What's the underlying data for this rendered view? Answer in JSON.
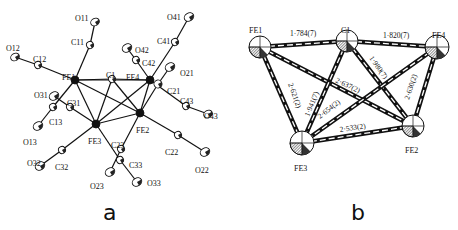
{
  "figure": {
    "panels": [
      {
        "id": "a",
        "letter": "a",
        "title": "ORTEP view of Fe4C(CO)12 cluster",
        "atoms": [
          {
            "label": "FE1",
            "x": 75,
            "y": 80,
            "r": 4,
            "type": "fe",
            "lx": 62,
            "ly": 74
          },
          {
            "label": "C1",
            "x": 112,
            "y": 79,
            "r": 3.5,
            "type": "c",
            "lx": 106,
            "ly": 72
          },
          {
            "label": "FE4",
            "x": 150,
            "y": 80,
            "r": 4,
            "type": "fe",
            "lx": 126,
            "ly": 74
          },
          {
            "label": "FE2",
            "x": 140,
            "y": 113,
            "r": 4,
            "type": "fe",
            "lx": 136,
            "ly": 127
          },
          {
            "label": "FE3",
            "x": 96,
            "y": 124,
            "r": 4,
            "type": "fe",
            "lx": 88,
            "ly": 138
          },
          {
            "label": "C11",
            "x": 90,
            "y": 45,
            "r": 3.5,
            "type": "c",
            "lx": 71,
            "ly": 39
          },
          {
            "label": "O11",
            "x": 95,
            "y": 22,
            "r": 4.5,
            "type": "o",
            "lx": 75,
            "ly": 15
          },
          {
            "label": "C12",
            "x": 38,
            "y": 65,
            "r": 3.5,
            "type": "c",
            "lx": 33,
            "ly": 56
          },
          {
            "label": "O12",
            "x": 15,
            "y": 57,
            "r": 4.5,
            "type": "o",
            "lx": 6,
            "ly": 45
          },
          {
            "label": "C41",
            "x": 175,
            "y": 42,
            "r": 3.5,
            "type": "c",
            "lx": 157,
            "ly": 38
          },
          {
            "label": "O41",
            "x": 189,
            "y": 17,
            "r": 5,
            "type": "o",
            "lx": 167,
            "ly": 14
          },
          {
            "label": "C42",
            "x": 136,
            "y": 60,
            "r": 3.5,
            "type": "c",
            "lx": 142,
            "ly": 60
          },
          {
            "label": "O42",
            "x": 127,
            "y": 48,
            "r": 5,
            "type": "o",
            "lx": 135,
            "ly": 47
          },
          {
            "label": "O21",
            "x": 170,
            "y": 67,
            "r": 5,
            "type": "o",
            "lx": 180,
            "ly": 70
          },
          {
            "label": "C21",
            "x": 158,
            "y": 84,
            "r": 4,
            "type": "c",
            "lx": 167,
            "ly": 88
          },
          {
            "label": "C43",
            "x": 186,
            "y": 106,
            "r": 3.5,
            "type": "c",
            "lx": 180,
            "ly": 98
          },
          {
            "label": "O43",
            "x": 208,
            "y": 114,
            "r": 4.5,
            "type": "o",
            "lx": 204,
            "ly": 113
          },
          {
            "label": "O31",
            "x": 54,
            "y": 96,
            "r": 5,
            "type": "o",
            "lx": 34,
            "ly": 92
          },
          {
            "label": "C31",
            "x": 70,
            "y": 107,
            "r": 3.5,
            "type": "c",
            "lx": 67,
            "ly": 100
          },
          {
            "label": "C13",
            "x": 53,
            "y": 107,
            "r": 3.5,
            "type": "c",
            "lx": 49,
            "ly": 119
          },
          {
            "label": "O13",
            "x": 38,
            "y": 126,
            "r": 5,
            "type": "o",
            "lx": 23,
            "ly": 139
          },
          {
            "label": "C32",
            "x": 62,
            "y": 150,
            "r": 3.5,
            "type": "c",
            "lx": 55,
            "ly": 164
          },
          {
            "label": "O32",
            "x": 40,
            "y": 166,
            "r": 5,
            "type": "o",
            "lx": 27,
            "ly": 160
          },
          {
            "label": "C23",
            "x": 121,
            "y": 149,
            "r": 3.5,
            "type": "c",
            "lx": 111,
            "ly": 142
          },
          {
            "label": "C33",
            "x": 120,
            "y": 160,
            "r": 3.5,
            "type": "c",
            "lx": 129,
            "ly": 162
          },
          {
            "label": "O23",
            "x": 110,
            "y": 172,
            "r": 5,
            "type": "o",
            "lx": 90,
            "ly": 183
          },
          {
            "label": "O33",
            "x": 137,
            "y": 182,
            "r": 5,
            "type": "o",
            "lx": 147,
            "ly": 180
          },
          {
            "label": "C22",
            "x": 178,
            "y": 135,
            "r": 3.5,
            "type": "c",
            "lx": 165,
            "ly": 149
          },
          {
            "label": "O22",
            "x": 205,
            "y": 152,
            "r": 5,
            "type": "o",
            "lx": 195,
            "ly": 167
          }
        ],
        "bonds": [
          [
            "FE1",
            "C1"
          ],
          [
            "C1",
            "FE4"
          ],
          [
            "FE1",
            "FE4"
          ],
          [
            "FE1",
            "FE2"
          ],
          [
            "FE1",
            "FE3"
          ],
          [
            "C1",
            "FE2"
          ],
          [
            "C1",
            "FE3"
          ],
          [
            "FE4",
            "FE2"
          ],
          [
            "FE4",
            "FE3"
          ],
          [
            "FE2",
            "FE3"
          ],
          [
            "FE1",
            "C11"
          ],
          [
            "C11",
            "O11"
          ],
          [
            "FE1",
            "C12"
          ],
          [
            "C12",
            "O12"
          ],
          [
            "FE1",
            "C13"
          ],
          [
            "C13",
            "O13"
          ],
          [
            "FE4",
            "C41"
          ],
          [
            "C41",
            "O41"
          ],
          [
            "FE4",
            "C42"
          ],
          [
            "C42",
            "O42"
          ],
          [
            "FE4",
            "C43"
          ],
          [
            "C43",
            "O43"
          ],
          [
            "FE2",
            "C21"
          ],
          [
            "C21",
            "O21"
          ],
          [
            "FE2",
            "C22"
          ],
          [
            "C22",
            "O22"
          ],
          [
            "FE2",
            "C23"
          ],
          [
            "C23",
            "O23"
          ],
          [
            "FE3",
            "C31"
          ],
          [
            "C31",
            "O31"
          ],
          [
            "FE3",
            "C32"
          ],
          [
            "C32",
            "O32"
          ],
          [
            "FE3",
            "C33"
          ],
          [
            "C33",
            "O33"
          ]
        ]
      },
      {
        "id": "b",
        "letter": "b",
        "title": "Fe4C core with bond distances",
        "atoms": [
          {
            "label": "FE1",
            "x": 260,
            "y": 47,
            "r": 11,
            "lx": 249,
            "ly": 27
          },
          {
            "label": "C1",
            "x": 347,
            "y": 41,
            "r": 11,
            "lx": 341,
            "ly": 27
          },
          {
            "label": "FE4",
            "x": 437,
            "y": 47,
            "r": 12,
            "lx": 432,
            "ly": 32
          },
          {
            "label": "FE2",
            "x": 413,
            "y": 126,
            "r": 11,
            "lx": 405,
            "ly": 147
          },
          {
            "label": "FE3",
            "x": 302,
            "y": 143,
            "r": 12,
            "lx": 294,
            "ly": 165
          }
        ],
        "bonds": [
          {
            "from": "FE1",
            "to": "C1",
            "label": "1·784(7)",
            "lx": 290,
            "ly": 36,
            "rot": 0
          },
          {
            "from": "C1",
            "to": "FE4",
            "label": "1·820(7)",
            "lx": 383,
            "ly": 38,
            "rot": 0
          },
          {
            "from": "C1",
            "to": "FE2",
            "label": "1·980(7)",
            "lx": 369,
            "ly": 58,
            "rot": 55
          },
          {
            "from": "FE1",
            "to": "FE2",
            "label": "2·637(2)",
            "lx": 335,
            "ly": 82,
            "rot": 25
          },
          {
            "from": "FE4",
            "to": "FE2",
            "label": "2·630(2)",
            "lx": 409,
            "ly": 100,
            "rot": -72
          },
          {
            "from": "FE1",
            "to": "FE3",
            "label": "2·621(2)",
            "lx": 288,
            "ly": 84,
            "rot": 70
          },
          {
            "from": "C1",
            "to": "FE3",
            "label": "1·941(7)",
            "lx": 309,
            "ly": 117,
            "rot": -68
          },
          {
            "from": "FE4",
            "to": "FE3",
            "label": "2·654(2)",
            "lx": 320,
            "ly": 119,
            "rot": -38
          },
          {
            "from": "FE3",
            "to": "FE2",
            "label": "2·533(2)",
            "lx": 340,
            "ly": 132,
            "rot": -8
          }
        ]
      }
    ]
  }
}
